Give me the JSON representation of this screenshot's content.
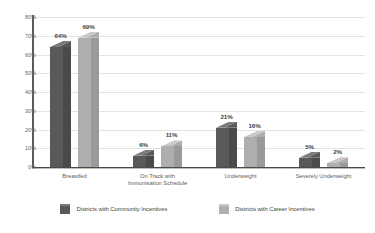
{
  "chart_data": {
    "type": "bar",
    "title": "",
    "subtitle": "",
    "xlabel": "",
    "ylabel": "",
    "ylim": [
      0,
      80
    ],
    "ytick_step": 10,
    "ytick_labels": [
      "0%",
      "10%",
      "20%",
      "30%",
      "40%",
      "50%",
      "60%",
      "70%",
      "80%"
    ],
    "ytick_values": [
      0,
      10,
      20,
      30,
      40,
      50,
      60,
      70,
      80
    ],
    "grid": true,
    "grid_axis": "y",
    "legend_position": "bottom",
    "value_labels": true,
    "value_label_suffix": "%",
    "style": "3d-clustered-column",
    "categories": [
      "Breastfed",
      "On Track with\nImmunisation Schedule",
      "Underweight",
      "Severely Underweight"
    ],
    "series": [
      {
        "name": "Districts with Community Incentives",
        "color": "#595959",
        "top_color": "#7b7b7b",
        "side_color": "#4a4a4a",
        "values": [
          64,
          69,
          21,
          5
        ],
        "labels": [
          "64%",
          "6%",
          "21%",
          "5%"
        ],
        "values_actual": [
          64,
          6,
          21,
          5
        ]
      },
      {
        "name": "Districts with Career Incentives",
        "color": "#aeaeae",
        "top_color": "#c9c9c9",
        "side_color": "#9a9a9a",
        "values_actual": [
          69,
          11,
          16,
          2
        ],
        "labels": [
          "69%",
          "11%",
          "16%",
          "2%"
        ]
      }
    ]
  },
  "colors": {
    "background": "#ffffff",
    "gridline": "#e3e3e3",
    "axis": "#4a4a4a",
    "tick_text": "#6b6b6b",
    "category_text": "#5e5e5e",
    "value_text": "#3d3d3d",
    "series_1": "#595959",
    "series_2": "#aeaeae"
  }
}
